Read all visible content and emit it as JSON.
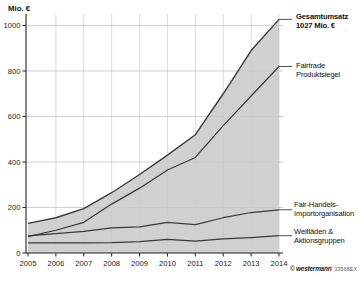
{
  "chart_data": {
    "type": "area",
    "title": "",
    "subtitle": "",
    "ylabel": "Mio. €",
    "xlabel": "",
    "x": [
      2005,
      2006,
      2007,
      2008,
      2009,
      2010,
      2011,
      2012,
      2013,
      2014
    ],
    "xlim": [
      2005,
      2014
    ],
    "ylim": [
      0,
      1060
    ],
    "yticks": [
      0,
      200,
      400,
      600,
      800,
      1000
    ],
    "grid": true,
    "legend_position": "right-annotations",
    "series": [
      {
        "name": "Gesamtumsatz",
        "values": [
          130,
          155,
          195,
          265,
          345,
          430,
          520,
          700,
          890,
          1027
        ]
      },
      {
        "name": "Fairtrade Produktsiegel",
        "values": [
          72,
          100,
          135,
          215,
          285,
          365,
          420,
          560,
          690,
          820
        ]
      },
      {
        "name": "Fair-Handels-Importorganisation",
        "values": [
          75,
          85,
          95,
          110,
          115,
          135,
          125,
          155,
          178,
          190
        ]
      },
      {
        "name": "Weltläden & Aktionsgruppen",
        "values": [
          44,
          45,
          45,
          46,
          50,
          60,
          52,
          62,
          68,
          76
        ]
      }
    ],
    "colors": {
      "area_fill": "#cacaca",
      "line": "#3a3a3a",
      "grid": "#c3c3c3",
      "axis": "#222222"
    }
  },
  "annotations": {
    "gesamtumsatz_line1": "Gesamtumsatz",
    "gesamtumsatz_line2": "1027 Mio. €",
    "fairtrade_line1": "Fairtrade",
    "fairtrade_line2": "Produktsiegel",
    "import_line1": "Fair-Handels-",
    "import_line2": "Importorganisation",
    "weltlaeden_line1": "Weltläden &",
    "weltlaeden_line2": "Aktionsgruppen"
  },
  "footer": {
    "copyright": "© westermann",
    "code": "33568EX"
  }
}
